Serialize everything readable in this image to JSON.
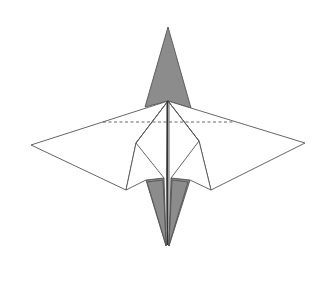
{
  "diagram": {
    "colors": {
      "paper": "#ffffff",
      "reverse_side": "#8c8c8c",
      "outline": "#555555"
    },
    "line_types": [
      "solid-edge",
      "valley-fold-dashed"
    ],
    "parts": [
      "top-point",
      "left-wing",
      "right-wing",
      "center-body",
      "lower-points",
      "valley-fold-line"
    ]
  }
}
